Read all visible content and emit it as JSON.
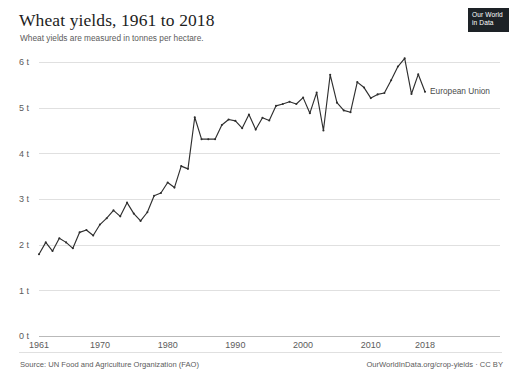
{
  "header": {
    "title": "Wheat yields, 1961 to 2018",
    "subtitle": "Wheat yields are measured in tonnes per hectare."
  },
  "logo": {
    "line1": "Our World",
    "line2": "in Data"
  },
  "footer": {
    "source": "Source: UN Food and Agriculture Organization (FAO)",
    "license": "OurWorldInData.org/crop-yields · CC BY"
  },
  "colors": {
    "line": "#2f2f2f",
    "gridline": "#e0e0e0",
    "axis_text": "#5b5b5b",
    "title_text": "#1d1d1d",
    "logo_background": "#1d2226"
  },
  "chart_data": {
    "type": "line",
    "title": "Wheat yields, 1961 to 2018",
    "subtitle": "Wheat yields are measured in tonnes per hectare.",
    "xlabel": "",
    "ylabel": "",
    "unit": "tonnes per hectare",
    "grid": true,
    "legend_position": "right-inline",
    "xlim": [
      1961,
      2018
    ],
    "ylim": [
      0,
      6.3
    ],
    "y_ticks": [
      0,
      1,
      2,
      3,
      4,
      5,
      6
    ],
    "y_tick_labels": [
      "0 t",
      "1 t",
      "2 t",
      "3 t",
      "4 t",
      "5 t",
      "6 t"
    ],
    "x_ticks": [
      1961,
      1970,
      1980,
      1990,
      2000,
      2010,
      2018
    ],
    "x_tick_labels": [
      "1961",
      "1970",
      "1980",
      "1990",
      "2000",
      "2010",
      "2018"
    ],
    "series": [
      {
        "name": "European Union",
        "color": "#2f2f2f",
        "x": [
          1961,
          1962,
          1963,
          1964,
          1965,
          1966,
          1967,
          1968,
          1969,
          1970,
          1971,
          1972,
          1973,
          1974,
          1975,
          1976,
          1977,
          1978,
          1979,
          1980,
          1981,
          1982,
          1983,
          1984,
          1985,
          1986,
          1987,
          1988,
          1989,
          1990,
          1991,
          1992,
          1993,
          1994,
          1995,
          1996,
          1997,
          1998,
          1999,
          2000,
          2001,
          2002,
          2003,
          2004,
          2005,
          2006,
          2007,
          2008,
          2009,
          2010,
          2011,
          2012,
          2013,
          2014,
          2015,
          2016,
          2017,
          2018
        ],
        "values": [
          1.79,
          2.05,
          1.86,
          2.14,
          2.05,
          1.92,
          2.27,
          2.32,
          2.2,
          2.44,
          2.58,
          2.75,
          2.62,
          2.92,
          2.68,
          2.52,
          2.71,
          3.07,
          3.13,
          3.36,
          3.25,
          3.72,
          3.66,
          4.79,
          4.31,
          4.31,
          4.31,
          4.62,
          4.74,
          4.71,
          4.55,
          4.85,
          4.52,
          4.78,
          4.72,
          5.04,
          5.08,
          5.13,
          5.08,
          5.22,
          4.88,
          5.33,
          4.5,
          5.72,
          5.11,
          4.94,
          4.9,
          5.56,
          5.44,
          5.21,
          5.29,
          5.32,
          5.6,
          5.9,
          6.08,
          5.3,
          5.73,
          5.35
        ]
      }
    ],
    "annotations": [
      {
        "text": "European Union",
        "x": 2018,
        "y": 5.35,
        "placement": "right"
      }
    ]
  }
}
